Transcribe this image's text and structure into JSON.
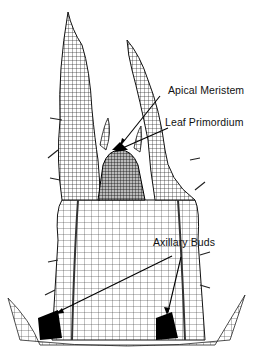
{
  "diagram": {
    "labels": [
      {
        "id": "apical-meristem",
        "text": "Apical Meristem"
      },
      {
        "id": "leaf-primordium",
        "text": "Leaf Primordium"
      },
      {
        "id": "axillary-buds",
        "text": "Axillary Buds"
      }
    ],
    "colors": {
      "ink": "#111111",
      "background": "#ffffff"
    }
  }
}
